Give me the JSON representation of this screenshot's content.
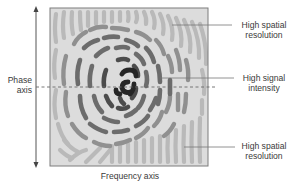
{
  "diagram": {
    "y_axis_label_line1": "Phase",
    "y_axis_label_line2": "axis",
    "x_axis_label": "Frequency axis",
    "annotations": [
      {
        "line1": "High spatial",
        "line2": "resolution"
      },
      {
        "line1": "High signal",
        "line2": "intensity"
      },
      {
        "line1": "High spatial",
        "line2": "resolution"
      }
    ],
    "colors": {
      "frame_bg": "#d9d9d9",
      "outer_strokes": "#b8b8b8",
      "mid_strokes": "#8a8a8a",
      "inner_strokes": "#5e5e5e",
      "center_strokes": "#2a2a2a",
      "frame_border": "#7a7a7a"
    }
  }
}
